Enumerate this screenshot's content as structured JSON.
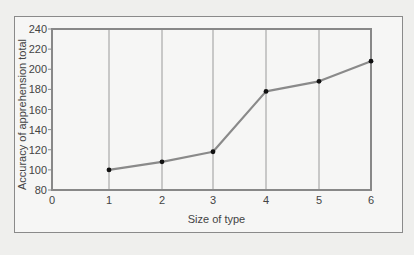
{
  "chart_data": {
    "type": "line",
    "title": "",
    "xlabel": "Size of type",
    "ylabel": "Accuracy of apprehension total",
    "x": [
      1,
      2,
      3,
      4,
      5,
      6
    ],
    "series": [
      {
        "name": "Accuracy of apprehension total",
        "values": [
          100,
          108,
          118,
          178,
          188,
          208
        ]
      }
    ],
    "xlim": [
      0,
      6
    ],
    "ylim": [
      80,
      240
    ],
    "x_ticks": [
      "0",
      "1",
      "2",
      "3",
      "4",
      "5",
      "6"
    ],
    "y_ticks": [
      "80",
      "100",
      "120",
      "140",
      "160",
      "180",
      "200",
      "220",
      "240"
    ],
    "grid": {
      "vertical": true,
      "horizontal": false
    },
    "legend": null,
    "colors": {
      "line": "#8a8a8a",
      "marker": "#111111",
      "axis": "#888888",
      "grid": "#9a9a9a"
    }
  }
}
